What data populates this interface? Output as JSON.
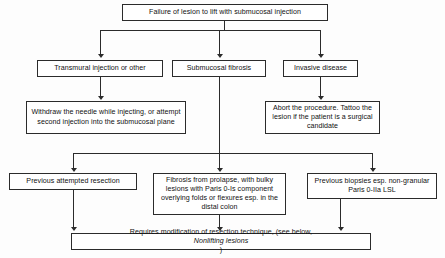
{
  "diagram": {
    "nodes": {
      "root": "Failure of lesion to lift with submucosal injection",
      "transmural": "Transmural injection or other",
      "fibrosis": "Submucosal fibrosis",
      "invasive": "Invasive disease",
      "withdraw": "Withdraw the needle while injecting, or attempt second injection into the submucosal plane",
      "abort": "Abort the procedure. Tattoo the lesion if the patient is a surgical candidate",
      "prev_resection": "Previous attempted resection",
      "prolapse": "Fibrosis from prolapse, with bulky lesions with Paris 0-Is component overlying folds or flexures esp. in the distal colon",
      "prev_biopsies": "Previous biopsies esp. non-granular Paris 0-IIa LSL",
      "outcome_lead": "Requires modification of resection technique, (see below, ",
      "outcome_italic": "Nonlifting lesions",
      "outcome_tail": ")"
    },
    "colors": {
      "stroke": "#2b2b2b",
      "box_fill": "#ffffff",
      "text": "#111111",
      "background": "#fdfdfd"
    }
  }
}
